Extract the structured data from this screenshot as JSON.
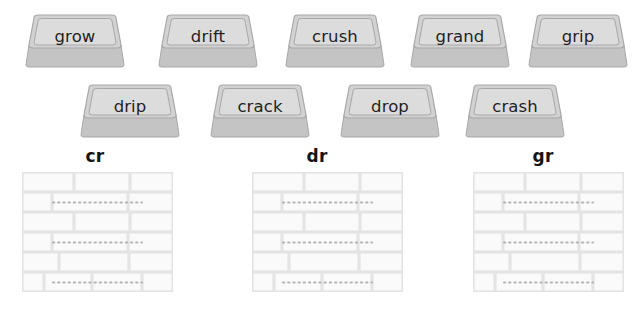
{
  "worksheet": {
    "title": "Consonant Blends Brick Sort",
    "tiles_row1": [
      {
        "word": "grow",
        "x": 25,
        "y": 14
      },
      {
        "word": "drift",
        "x": 158,
        "y": 14
      },
      {
        "word": "crush",
        "x": 285,
        "y": 14
      },
      {
        "word": "grand",
        "x": 410,
        "y": 14
      },
      {
        "word": "grip",
        "x": 528,
        "y": 14
      }
    ],
    "tiles_row2": [
      {
        "word": "drip",
        "x": 80,
        "y": 84
      },
      {
        "word": "crack",
        "x": 210,
        "y": 84
      },
      {
        "word": "drop",
        "x": 340,
        "y": 84
      },
      {
        "word": "crash",
        "x": 465,
        "y": 84
      }
    ],
    "columns": [
      {
        "heading": "cr",
        "x": 10
      },
      {
        "heading": "dr",
        "x": 232,
        "wall_x": 252
      },
      {
        "heading": "gr",
        "x": 458,
        "wall_x": 473
      }
    ],
    "wall": {
      "rows": 6,
      "answer_line_rows": [
        2,
        4,
        6
      ],
      "answer_lines_per_wall": 3,
      "answer_line_value": ""
    },
    "colors": {
      "tile_top_fill": "#d2d2d2",
      "tile_inner_fill": "#dcdcdc",
      "tile_side_fill": "#c4c4c4",
      "tile_outline": "#a8a8a8",
      "tile_text": "#1f1f1f",
      "heading_text": "#141414",
      "wall_brick_fill": "#fafafa",
      "wall_mortar": "#e4e4e4",
      "wall_dotted_guide": "#b4b4b4",
      "page_background": "#ffffff"
    }
  }
}
